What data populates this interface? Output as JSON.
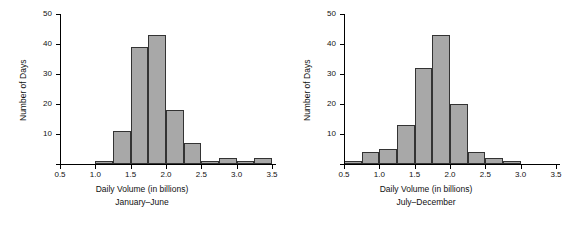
{
  "chart_data": [
    {
      "type": "bar",
      "title": "",
      "xlabel": "Daily Volume (in billions)",
      "subtitle": "January–June",
      "ylabel": "Number of Days",
      "xlim": [
        0.5,
        3.5
      ],
      "ylim": [
        0,
        50
      ],
      "xticks": [
        "0.5",
        "1.0",
        "1.5",
        "2.0",
        "2.5",
        "3.0",
        "3.5"
      ],
      "yticks": [
        "10",
        "20",
        "30",
        "40",
        "50"
      ],
      "grid": false,
      "legend": false,
      "bin_width": 0.25,
      "bins": [
        {
          "start": 1.0,
          "end": 1.25,
          "value": 1
        },
        {
          "start": 1.25,
          "end": 1.5,
          "value": 11
        },
        {
          "start": 1.5,
          "end": 1.75,
          "value": 39
        },
        {
          "start": 1.75,
          "end": 2.0,
          "value": 43
        },
        {
          "start": 2.0,
          "end": 2.25,
          "value": 18
        },
        {
          "start": 2.25,
          "end": 2.5,
          "value": 7
        },
        {
          "start": 2.5,
          "end": 2.75,
          "value": 1
        },
        {
          "start": 2.75,
          "end": 3.0,
          "value": 2
        },
        {
          "start": 3.0,
          "end": 3.25,
          "value": 1
        },
        {
          "start": 3.25,
          "end": 3.5,
          "value": 2
        }
      ]
    },
    {
      "type": "bar",
      "title": "",
      "xlabel": "Daily Volume (in billions)",
      "subtitle": "July–December",
      "ylabel": "Number of Days",
      "xlim": [
        0.5,
        3.5
      ],
      "ylim": [
        0,
        50
      ],
      "xticks": [
        "0.5",
        "1.0",
        "1.5",
        "2.0",
        "2.5",
        "3.0",
        "3.5"
      ],
      "yticks": [
        "10",
        "20",
        "30",
        "40",
        "50"
      ],
      "grid": false,
      "legend": false,
      "bin_width": 0.25,
      "bins": [
        {
          "start": 0.5,
          "end": 0.75,
          "value": 1
        },
        {
          "start": 0.75,
          "end": 1.0,
          "value": 4
        },
        {
          "start": 1.0,
          "end": 1.25,
          "value": 5
        },
        {
          "start": 1.25,
          "end": 1.5,
          "value": 13
        },
        {
          "start": 1.5,
          "end": 1.75,
          "value": 32
        },
        {
          "start": 1.75,
          "end": 2.0,
          "value": 43
        },
        {
          "start": 2.0,
          "end": 2.25,
          "value": 20
        },
        {
          "start": 2.25,
          "end": 2.5,
          "value": 4
        },
        {
          "start": 2.5,
          "end": 2.75,
          "value": 2
        },
        {
          "start": 2.75,
          "end": 3.0,
          "value": 1
        }
      ]
    }
  ]
}
